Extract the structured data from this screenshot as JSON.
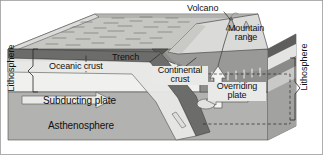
{
  "figure": {
    "type": "geology-cross-section-diagram",
    "background_color": "#ffffff"
  },
  "labels": {
    "volcano": "Volcano",
    "mountain_range_line1": "Mountain",
    "mountain_range_line2": "range",
    "trench": "Trench",
    "oceanic_crust": "Oceanic crust",
    "continental_crust_line1": "Continental",
    "continental_crust_line2": "crust",
    "overriding_plate_line1": "Overriding",
    "overriding_plate_line2": "plate",
    "subducting_plate": "Subducting plate",
    "asthenosphere": "Asthenosphere",
    "lithosphere_left": "Lithosphere",
    "lithosphere_right": "Lithosphere"
  },
  "colors": {
    "ocean_surface": "#c9c9c7",
    "ocean_surface_dark": "#a9a9a7",
    "block_side_light": "#d6d6d4",
    "crust_band_dark": "#6e6e6e",
    "subducting_plate_fill": "#efefee",
    "asthenosphere_fill": "#b0b0ae",
    "mountain_fill": "#d9d9d7",
    "slab_fill": "#8f8f8d",
    "label_box": "#e9e9e7",
    "outline": "#3a3a3a",
    "text": "#111111",
    "arrow_fill": "#e6e6e4"
  },
  "annotations": {
    "slab_motion_arrow": "down-right subducting slab arrow",
    "overriding_motion_arrow": "left-pointing arrow under Overriding plate",
    "magma_arrow": "upward white arrow feeding volcano",
    "bracket_left": "lithosphere thickness bracket on left edge",
    "bracket_right": "lithosphere thickness bracket on right edge"
  }
}
